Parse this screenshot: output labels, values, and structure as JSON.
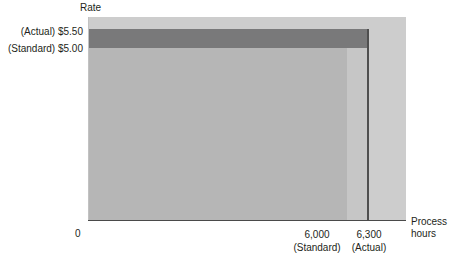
{
  "chart_data": {
    "type": "area",
    "title": "",
    "ylabel": "Rate",
    "xlabel_line1": "Process",
    "xlabel_line2": "hours",
    "origin_label": "0",
    "grid": false,
    "legend_position": "none",
    "xlim": [
      0,
      7000
    ],
    "ylim": [
      0,
      6.25
    ],
    "x_ticks": [
      {
        "value": 6000,
        "label": "6,000",
        "sublabel": "(Standard)"
      },
      {
        "value": 6300,
        "label": "6,300",
        "sublabel": "(Actual)"
      }
    ],
    "y_ticks": [
      {
        "value": 5.5,
        "label": "(Actual) $5.50"
      },
      {
        "value": 5.0,
        "label": "(Standard) $5.00"
      }
    ],
    "regions": [
      {
        "name": "rate-variance",
        "description": "Rate variance band between standard rate $5.00 and actual rate $5.50 across actual hours",
        "x_from": 0,
        "x_to": 6300,
        "y_from": 5.0,
        "y_to": 5.5,
        "color": "#79797a"
      },
      {
        "name": "standard-cost",
        "description": "Standard rate applied to standard hours",
        "x_from": 0,
        "x_to": 6000,
        "y_from": 0,
        "y_to": 5.0,
        "color": "#b6b6b6"
      },
      {
        "name": "efficiency-variance",
        "description": "Efficiency variance: extra 300 hours at standard rate",
        "x_from": 6000,
        "x_to": 6300,
        "y_from": 0,
        "y_to": 5.0,
        "color": "#c6c6c6"
      }
    ],
    "panel_color": "#cdcdcd",
    "axis_color": "#4a4a4a",
    "values": {
      "standard_rate": 5.0,
      "actual_rate": 5.5,
      "standard_hours": 6000,
      "actual_hours": 6300
    }
  },
  "axes": {
    "y_title": "Rate",
    "x_title_line1": "Process",
    "x_title_line2": "hours",
    "origin": "0"
  },
  "labels": {
    "actual_rate": "(Actual) $5.50",
    "standard_rate": "(Standard) $5.00",
    "standard_hours": "6,000",
    "standard_hours_sub": "(Standard)",
    "actual_hours": "6,300",
    "actual_hours_sub": "(Actual)"
  }
}
